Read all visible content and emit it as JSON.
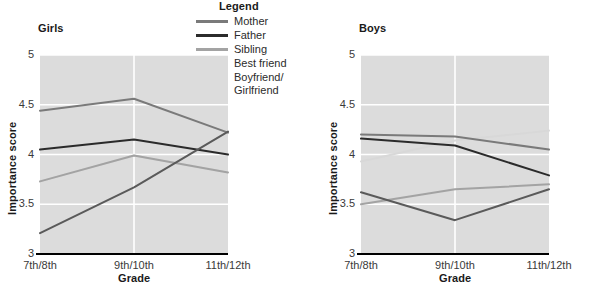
{
  "legend": {
    "title": "Legend",
    "entries": [
      {
        "label": "Mother",
        "color": "#7a7a7a"
      },
      {
        "label": "Father",
        "color": "#2b2b2b"
      },
      {
        "label": "Sibling",
        "color": "#a3a3a3"
      },
      {
        "label": "Best friend",
        "color": "#d8d8d8"
      },
      {
        "label": "Boyfriend/\nGirlfriend",
        "color": "#5a5a5a"
      }
    ]
  },
  "chart_data": [
    {
      "type": "line",
      "title": "Girls",
      "xlabel": "Grade",
      "ylabel": "Importance score",
      "categories": [
        "7th/8th",
        "9th/10th",
        "11th/12th"
      ],
      "yticks": [
        "3",
        "3.5",
        "4",
        "4.5",
        "5"
      ],
      "ylim": [
        3,
        5
      ],
      "grid": true,
      "legend_position": "top-center-shared",
      "series": [
        {
          "name": "Mother",
          "color": "#7a7a7a",
          "values": [
            4.44,
            4.56,
            4.22
          ]
        },
        {
          "name": "Father",
          "color": "#2b2b2b",
          "values": [
            4.05,
            4.15,
            4.0
          ]
        },
        {
          "name": "Sibling",
          "color": "#a3a3a3",
          "values": [
            3.73,
            3.99,
            3.82
          ]
        },
        {
          "name": "Best friend",
          "color": "#d8d8d8",
          "values": [
            3.73,
            3.99,
            3.82
          ]
        },
        {
          "name": "Boyfriend/Girlfriend",
          "color": "#5a5a5a",
          "values": [
            3.21,
            3.67,
            4.23
          ]
        }
      ]
    },
    {
      "type": "line",
      "title": "Boys",
      "xlabel": "Grade",
      "ylabel": "Importance score",
      "categories": [
        "7th/8th",
        "9th/10th",
        "11th/12th"
      ],
      "yticks": [
        "3",
        "3.5",
        "4",
        "4.5",
        "5"
      ],
      "ylim": [
        3,
        5
      ],
      "grid": true,
      "legend_position": "top-center-shared",
      "series": [
        {
          "name": "Mother",
          "color": "#7a7a7a",
          "values": [
            4.2,
            4.18,
            4.05
          ]
        },
        {
          "name": "Father",
          "color": "#2b2b2b",
          "values": [
            4.16,
            4.09,
            3.79
          ]
        },
        {
          "name": "Sibling",
          "color": "#a3a3a3",
          "values": [
            3.5,
            3.65,
            3.7
          ]
        },
        {
          "name": "Best friend",
          "color": "#d8d8d8",
          "values": [
            3.93,
            4.14,
            4.24
          ]
        },
        {
          "name": "Boyfriend/Girlfriend",
          "color": "#5a5a5a",
          "values": [
            3.62,
            3.34,
            3.65
          ]
        }
      ]
    }
  ]
}
